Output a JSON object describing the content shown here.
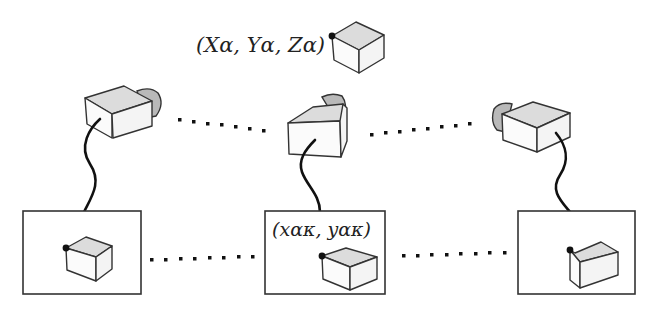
{
  "diagram": {
    "world_point": {
      "label": "(Xα, Yα, Zα)",
      "icon": "cube-icon"
    },
    "cameras": [
      {
        "id": "camera-left",
        "icon": "camera-icon"
      },
      {
        "id": "camera-center",
        "icon": "camera-icon"
      },
      {
        "id": "camera-right",
        "icon": "camera-icon"
      }
    ],
    "image_planes": [
      {
        "id": "image-left",
        "label": ""
      },
      {
        "id": "image-center",
        "label": "(xακ, yακ)"
      },
      {
        "id": "image-right",
        "label": ""
      }
    ],
    "connectors": {
      "camera_row": "dotted ellipsis between cameras",
      "image_row": "dotted ellipsis between images"
    },
    "colors": {
      "stroke": "#333333",
      "cube_top": "#dcdcdc",
      "lens": "#b9b9b9",
      "cable": "#111111"
    }
  }
}
